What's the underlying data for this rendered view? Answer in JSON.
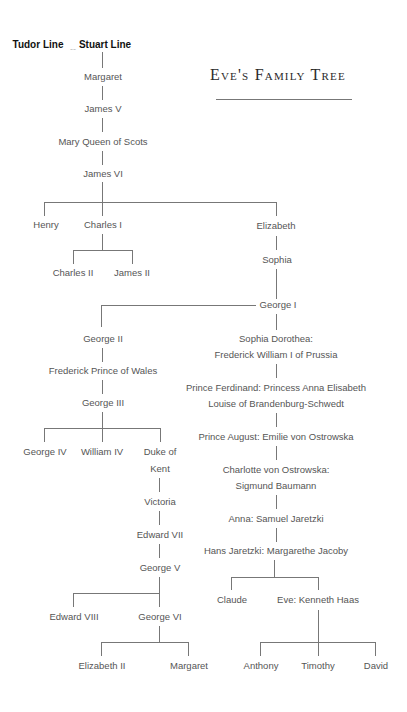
{
  "title": "Eve's Family Tree",
  "header": {
    "tudor_line": "Tudor Line",
    "separator": "--",
    "stuart_line": "Stuart Line"
  },
  "people": {
    "margaret": "Margaret",
    "james_v": "James V",
    "mary_queen_of_scots": "Mary Queen of Scots",
    "james_vi": "James VI",
    "henry": "Henry",
    "charles_i": "Charles I",
    "elizabeth": "Elizabeth",
    "charles_ii": "Charles II",
    "james_ii": "James II",
    "sophia": "Sophia",
    "george_i": "George I",
    "george_ii": "George II",
    "frederick_prince_of_wales": "Frederick Prince of Wales",
    "george_iii": "George III",
    "george_iv": "George IV",
    "william_iv": "William IV",
    "duke_of_kent_1": "Duke of",
    "duke_of_kent_2": "Kent",
    "victoria": "Victoria",
    "edward_vii": "Edward VII",
    "george_v": "George V",
    "edward_viii": "Edward VIII",
    "george_vi": "George VI",
    "elizabeth_ii": "Elizabeth II",
    "margaret_2": "Margaret",
    "sophia_dorothea_1": "Sophia Dorothea:",
    "sophia_dorothea_2": "Frederick William I of Prussia",
    "prince_ferdinand_1": "Prince Ferdinand: Princess Anna Elisabeth",
    "prince_ferdinand_2": "Louise of Brandenburg-Schwedt",
    "prince_august": "Prince August: Emilie von Ostrowska",
    "charlotte_1": "Charlotte von Ostrowska:",
    "charlotte_2": "Sigmund Baumann",
    "anna": "Anna: Samuel Jaretzki",
    "hans": "Hans Jaretzki: Margarethe Jacoby",
    "claude": "Claude",
    "eve": "Eve: Kenneth Haas",
    "anthony": "Anthony",
    "timothy": "Timothy",
    "david": "David"
  }
}
